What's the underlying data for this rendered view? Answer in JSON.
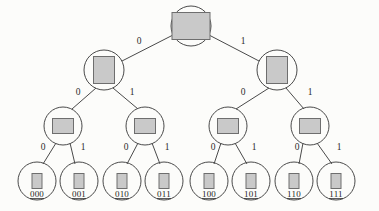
{
  "diagram": {
    "type": "binary-tree",
    "background_color": "#fcfcfa",
    "node_fill_color": "#c9c9c9",
    "node_stroke_color": "#6e6e6e",
    "edge_color": "#4a4a4a",
    "label_color": "#1f1f1f",
    "edge_label_left": "0",
    "edge_label_right": "1"
  },
  "nodes": {
    "root": {
      "id": "root",
      "cx": 191,
      "cy": 26,
      "r": 20,
      "rect_w": 38,
      "rect_h": 27,
      "level": 0,
      "label": ""
    },
    "level2": [
      {
        "id": "n0",
        "cx": 104,
        "cy": 70,
        "r": 20,
        "rect_w": 21,
        "rect_h": 27,
        "level": 1,
        "label": ""
      },
      {
        "id": "n1",
        "cx": 277,
        "cy": 70,
        "r": 20,
        "rect_w": 21,
        "rect_h": 27,
        "level": 1,
        "label": ""
      }
    ],
    "level3": [
      {
        "id": "n00",
        "cx": 63,
        "cy": 126,
        "r": 19,
        "rect_w": 21,
        "rect_h": 15,
        "level": 2,
        "label": ""
      },
      {
        "id": "n01",
        "cx": 145,
        "cy": 126,
        "r": 19,
        "rect_w": 21,
        "rect_h": 15,
        "level": 2,
        "label": ""
      },
      {
        "id": "n10",
        "cx": 228,
        "cy": 126,
        "r": 19,
        "rect_w": 21,
        "rect_h": 15,
        "level": 2,
        "label": ""
      },
      {
        "id": "n11",
        "cx": 310,
        "cy": 126,
        "r": 19,
        "rect_w": 21,
        "rect_h": 15,
        "level": 2,
        "label": ""
      }
    ],
    "leaves": [
      {
        "id": "l000",
        "cx": 37,
        "cy": 181,
        "r": 19,
        "rect_w": 10,
        "rect_h": 15,
        "level": 3,
        "label": "000"
      },
      {
        "id": "l001",
        "cx": 79,
        "cy": 181,
        "r": 19,
        "rect_w": 10,
        "rect_h": 15,
        "level": 3,
        "label": "001"
      },
      {
        "id": "l010",
        "cx": 122,
        "cy": 181,
        "r": 19,
        "rect_w": 10,
        "rect_h": 15,
        "level": 3,
        "label": "010"
      },
      {
        "id": "l011",
        "cx": 164,
        "cy": 181,
        "r": 19,
        "rect_w": 10,
        "rect_h": 15,
        "level": 3,
        "label": "011"
      },
      {
        "id": "l100",
        "cx": 209,
        "cy": 181,
        "r": 19,
        "rect_w": 10,
        "rect_h": 15,
        "level": 3,
        "label": "100"
      },
      {
        "id": "l101",
        "cx": 251,
        "cy": 181,
        "r": 19,
        "rect_w": 10,
        "rect_h": 15,
        "level": 3,
        "label": "101"
      },
      {
        "id": "l110",
        "cx": 294,
        "cy": 181,
        "r": 19,
        "rect_w": 10,
        "rect_h": 15,
        "level": 3,
        "label": "110"
      },
      {
        "id": "l111",
        "cx": 336,
        "cy": 181,
        "r": 19,
        "rect_w": 10,
        "rect_h": 15,
        "level": 3,
        "label": "111"
      }
    ]
  },
  "edges": [
    {
      "id": "e-root-n0",
      "x1": 173,
      "y1": 35,
      "x2": 122,
      "y2": 61,
      "label": "0",
      "lx": 139,
      "ly": 44
    },
    {
      "id": "e-root-n1",
      "x1": 209,
      "y1": 35,
      "x2": 259,
      "y2": 61,
      "label": "1",
      "lx": 243,
      "ly": 44
    },
    {
      "id": "e-n0-n00",
      "x1": 96,
      "y1": 88,
      "x2": 72,
      "y2": 109,
      "label": "0",
      "lx": 78,
      "ly": 95
    },
    {
      "id": "e-n0-n01",
      "x1": 113,
      "y1": 88,
      "x2": 138,
      "y2": 109,
      "label": "1",
      "lx": 132,
      "ly": 95
    },
    {
      "id": "e-n1-n10",
      "x1": 269,
      "y1": 88,
      "x2": 236,
      "y2": 109,
      "label": "0",
      "lx": 243,
      "ly": 95
    },
    {
      "id": "e-n1-n11",
      "x1": 286,
      "y1": 88,
      "x2": 304,
      "y2": 109,
      "label": "1",
      "lx": 310,
      "ly": 95
    },
    {
      "id": "e-n00-l000",
      "x1": 56,
      "y1": 143,
      "x2": 43,
      "y2": 164,
      "label": "0",
      "lx": 43,
      "ly": 150
    },
    {
      "id": "e-n00-l001",
      "x1": 70,
      "y1": 143,
      "x2": 75,
      "y2": 164,
      "label": "1",
      "lx": 83,
      "ly": 150
    },
    {
      "id": "e-n01-l010",
      "x1": 138,
      "y1": 143,
      "x2": 127,
      "y2": 164,
      "label": "0",
      "lx": 126,
      "ly": 150
    },
    {
      "id": "e-n01-l011",
      "x1": 152,
      "y1": 143,
      "x2": 160,
      "y2": 164,
      "label": "1",
      "lx": 167,
      "ly": 150
    },
    {
      "id": "e-n10-l100",
      "x1": 221,
      "y1": 143,
      "x2": 214,
      "y2": 164,
      "label": "0",
      "lx": 213,
      "ly": 150
    },
    {
      "id": "e-n10-l101",
      "x1": 235,
      "y1": 143,
      "x2": 247,
      "y2": 164,
      "label": "1",
      "lx": 254,
      "ly": 150
    },
    {
      "id": "e-n11-l110",
      "x1": 303,
      "y1": 143,
      "x2": 299,
      "y2": 164,
      "label": "0",
      "lx": 297,
      "ly": 150
    },
    {
      "id": "e-n11-l111",
      "x1": 317,
      "y1": 143,
      "x2": 332,
      "y2": 164,
      "label": "1",
      "lx": 339,
      "ly": 150
    }
  ]
}
